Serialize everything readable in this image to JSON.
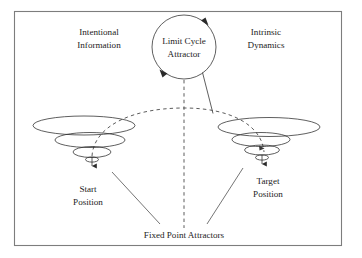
{
  "figure": {
    "type": "conceptual-dynamical-systems-diagram",
    "frame": {
      "border_color": "#7d7d7d",
      "background": "#ffffff"
    },
    "ink_color": "#2a2a2a",
    "labels": {
      "left_heading_line1": "Intentional",
      "left_heading_line2": "Information",
      "right_heading_line1": "Intrinsic",
      "right_heading_line2": "Dynamics",
      "circle_line1": "Limit Cycle",
      "circle_line2": "Attractor",
      "start_line1": "Start",
      "start_line2": "Position",
      "target_line1": "Target",
      "target_line2": "Position",
      "caption": "Fixed Point Attractors"
    },
    "elements": {
      "limit_cycle_attractor": {
        "name": "Limit Cycle Attractor",
        "shape": "circle",
        "center_x": 184,
        "center_y": 47,
        "radius": 32,
        "rotation_arrowheads": 2
      },
      "start_attractor": {
        "name": "Start Position fixed point attractor",
        "shape": "nested-ellipse-funnel",
        "center_x": 84,
        "apex_x": 92,
        "apex_y": 160,
        "ellipse_count": 3
      },
      "target_attractor": {
        "name": "Target Position fixed point attractor",
        "shape": "nested-ellipse-funnel",
        "center_x": 269,
        "apex_x": 262,
        "apex_y": 158,
        "ellipse_count": 3
      },
      "trajectory": {
        "name": "dashed trajectory arc from start to target",
        "style": "dashed",
        "from": "start_attractor",
        "to": "target_attractor"
      },
      "vertical_axis": {
        "name": "vertical dashed line below limit cycle attractor",
        "style": "dashed",
        "x": 184,
        "y_top": 80,
        "y_bottom": 228
      },
      "coupling_line": {
        "name": "solid line from limit cycle attractor to trajectory",
        "style": "solid"
      }
    }
  }
}
